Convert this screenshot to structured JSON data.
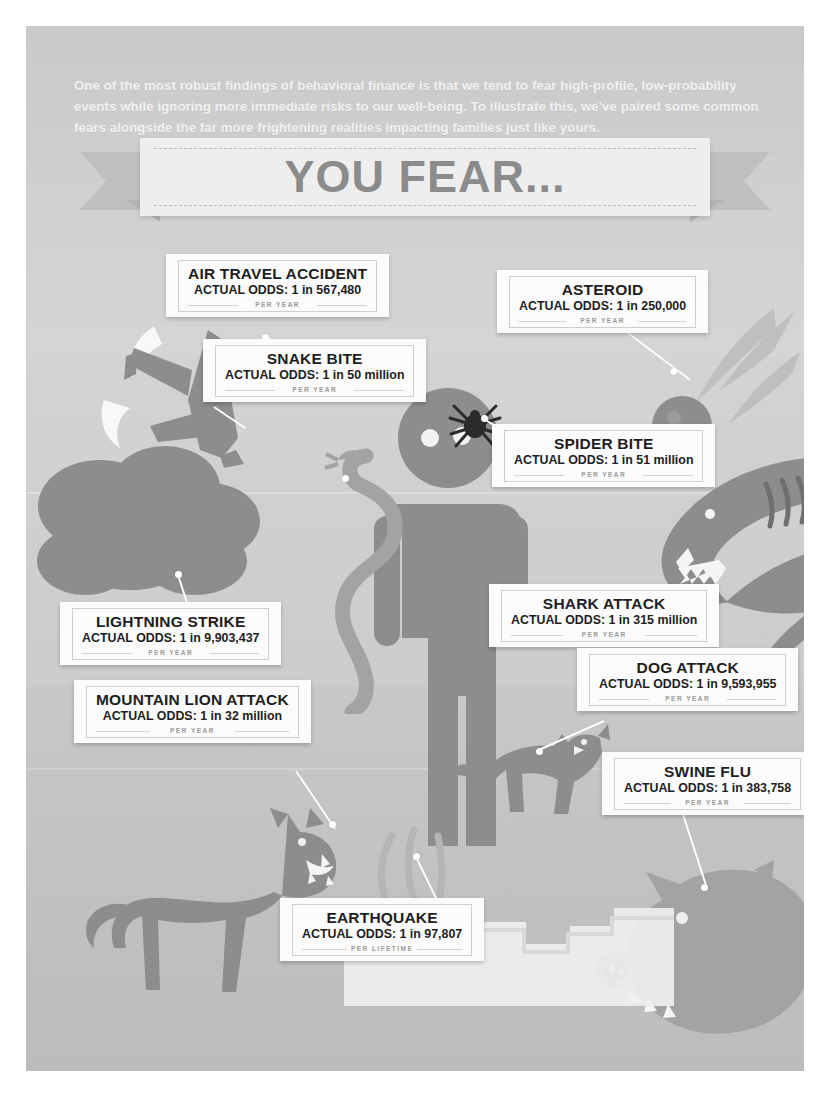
{
  "poster": {
    "intro": "One of the most robust findings of behavioral finance is that we tend to fear high-profile, low-probability events while ignoring more immediate risks to our well-being. To illustrate this, we've paired some common fears alongside the far more frightening realities impacting families just like yours.",
    "banner_title": "YOU FEAR...",
    "colors": {
      "background": "#cfcfcf",
      "ground": "#c2c2c2",
      "callout_bg": "#fbfbfb",
      "title_text": "#1e1e1e",
      "banner_text": "#8c8c8c",
      "leader_line": "#ffffff",
      "illustration_dark": "#8d8d8d",
      "illustration_mid": "#a3a3a3"
    }
  },
  "callouts": [
    {
      "id": "air-travel-accident",
      "title": "AIR TRAVEL ACCIDENT",
      "odds": "ACTUAL ODDS: 1 in 567,480",
      "period": "PER YEAR"
    },
    {
      "id": "asteroid",
      "title": "ASTEROID",
      "odds": "ACTUAL ODDS: 1 in 250,000",
      "period": "PER YEAR"
    },
    {
      "id": "snake-bite",
      "title": "SNAKE BITE",
      "odds": "ACTUAL ODDS: 1 in 50 million",
      "period": "PER YEAR"
    },
    {
      "id": "spider-bite",
      "title": "SPIDER BITE",
      "odds": "ACTUAL ODDS: 1 in 51 million",
      "period": "PER YEAR"
    },
    {
      "id": "shark-attack",
      "title": "SHARK ATTACK",
      "odds": "ACTUAL ODDS: 1 in 315 million",
      "period": "PER YEAR"
    },
    {
      "id": "lightning-strike",
      "title": "LIGHTNING STRIKE",
      "odds": "ACTUAL ODDS: 1 in 9,903,437",
      "period": "PER YEAR"
    },
    {
      "id": "dog-attack",
      "title": "DOG ATTACK",
      "odds": "ACTUAL ODDS: 1 in 9,593,955",
      "period": "PER YEAR"
    },
    {
      "id": "mountain-lion-attack",
      "title": "MOUNTAIN LION ATTACK",
      "odds": "ACTUAL ODDS: 1 in 32 million",
      "period": "PER YEAR"
    },
    {
      "id": "swine-flu",
      "title": "SWINE FLU",
      "odds": "ACTUAL ODDS: 1 in 383,758",
      "period": "PER YEAR"
    },
    {
      "id": "earthquake",
      "title": "EARTHQUAKE",
      "odds": "ACTUAL ODDS: 1 in 97,807",
      "period": "PER LIFETIME"
    }
  ],
  "illustrations": [
    {
      "id": "airplane",
      "name": "crashing-airplane-icon"
    },
    {
      "id": "storm-cloud",
      "name": "storm-cloud-icon"
    },
    {
      "id": "asteroid",
      "name": "flaming-asteroid-icon"
    },
    {
      "id": "person",
      "name": "person-pictogram-icon"
    },
    {
      "id": "snake",
      "name": "snake-icon"
    },
    {
      "id": "spider",
      "name": "spider-icon"
    },
    {
      "id": "shark",
      "name": "shark-icon"
    },
    {
      "id": "dog",
      "name": "attacking-dog-icon"
    },
    {
      "id": "mountain-lion",
      "name": "mountain-lion-icon"
    },
    {
      "id": "pig",
      "name": "pig-icon"
    },
    {
      "id": "earthquake-crack",
      "name": "earthquake-crack-icon"
    }
  ]
}
